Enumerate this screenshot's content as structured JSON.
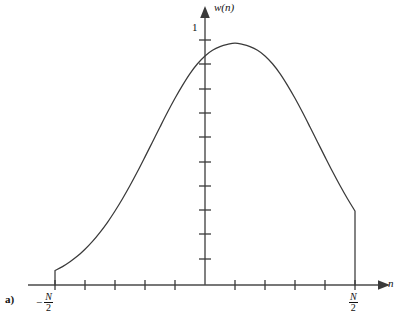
{
  "figure": {
    "panel_label": "a)",
    "caption": "",
    "colors": {
      "axis": "#4a4a4a",
      "curve": "#3a3a3a",
      "text": "#111111",
      "background": "#ffffff"
    }
  },
  "axes": {
    "y_axis_label": "w(n)",
    "x_axis_label": "n",
    "y_tick_label_one": "1",
    "x_tick_label_left": {
      "sign": "−",
      "numerator": "N",
      "denominator": "2"
    },
    "x_tick_label_right": {
      "sign": "",
      "numerator": "N",
      "denominator": "2"
    }
  },
  "chart_data": {
    "type": "line",
    "title": "",
    "xlabel": "n",
    "ylabel": "w(n)",
    "xlim": [
      -1.32,
      1.32
    ],
    "ylim": [
      -0.06,
      1.18
    ],
    "grid": false,
    "legend": null,
    "annotations": [
      {
        "text": "1",
        "x": -0.1,
        "y": 1.0,
        "note": "peak amplitude marker on y-axis"
      },
      {
        "text": "a)",
        "x": -1.32,
        "y": -0.12,
        "note": "panel identifier"
      }
    ],
    "x_ticks": {
      "values": [
        -1.0,
        -0.8,
        -0.6,
        -0.4,
        -0.2,
        0.0,
        0.2,
        0.4,
        0.6,
        0.8,
        1.0
      ],
      "labels": [
        "-N/2",
        "",
        "",
        "",
        "",
        "",
        "",
        "",
        "",
        "",
        "N/2"
      ],
      "pixel_positions": [
        55,
        85,
        115,
        145,
        175,
        205,
        235,
        265,
        295,
        325,
        355
      ]
    },
    "y_ticks": {
      "values": [
        0.1,
        0.2,
        0.3,
        0.4,
        0.5,
        0.6,
        0.7,
        0.8,
        0.9,
        1.0
      ],
      "labels": [
        "",
        "",
        "",
        "",
        "",
        "",
        "",
        "",
        "",
        "1"
      ],
      "pixel_positions": [
        259,
        234,
        210,
        186,
        162,
        137,
        113,
        89,
        64,
        40
      ]
    },
    "series": [
      {
        "name": "w(n) gaussian window",
        "comment": "Gaussian window w(n)=exp(-0.5*(n/(sigma*N/2))^2) with sigma=0.42, truncated at n=+-N/2",
        "x": [
          -1.0,
          -0.95,
          -0.9,
          -0.85,
          -0.8,
          -0.75,
          -0.7,
          -0.65,
          -0.6,
          -0.55,
          -0.5,
          -0.45,
          -0.4,
          -0.35,
          -0.3,
          -0.25,
          -0.2,
          -0.15,
          -0.1,
          -0.05,
          0.0,
          0.05,
          0.1,
          0.15,
          0.2,
          0.25,
          0.3,
          0.35,
          0.4,
          0.45,
          0.5,
          0.55,
          0.6,
          0.65,
          0.7,
          0.75,
          0.8,
          0.85,
          0.9,
          0.95,
          1.0
        ],
        "y": [
          0.059,
          0.075,
          0.095,
          0.118,
          0.146,
          0.178,
          0.215,
          0.256,
          0.302,
          0.352,
          0.406,
          0.463,
          0.523,
          0.584,
          0.645,
          0.705,
          0.762,
          0.815,
          0.863,
          0.903,
          0.935,
          0.958,
          0.973,
          0.982,
          0.987,
          0.982,
          0.973,
          0.958,
          0.935,
          0.903,
          0.863,
          0.815,
          0.762,
          0.705,
          0.645,
          0.584,
          0.523,
          0.463,
          0.406,
          0.352,
          0.302
        ],
        "endpoints_drop_to_axis": true
      }
    ]
  }
}
